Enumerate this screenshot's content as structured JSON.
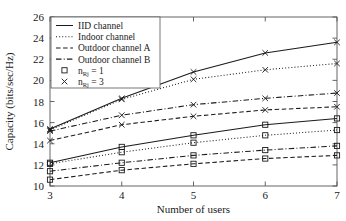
{
  "chart_data": {
    "type": "line",
    "title": "",
    "xlabel": "Number of users",
    "ylabel": "Capacity (bits/sec/Hz)",
    "x": [
      3,
      4,
      5,
      6,
      7
    ],
    "xlim": [
      3,
      7
    ],
    "ylim": [
      10,
      26
    ],
    "xticks": [
      "3",
      "4",
      "5",
      "6",
      "7"
    ],
    "yticks": [
      "10",
      "12",
      "14",
      "16",
      "18",
      "20",
      "22",
      "24",
      "26"
    ],
    "grid": false,
    "legend_position": "top-left",
    "series": [
      {
        "name": "IID channel, n_Rj = 3",
        "channel": "IID channel",
        "marker": "x",
        "linestyle": "solid",
        "values": [
          15.4,
          18.3,
          20.8,
          22.6,
          23.6
        ]
      },
      {
        "name": "Indoor channel, n_Rj = 3",
        "channel": "Indoor channel",
        "marker": "x",
        "linestyle": "dotted",
        "values": [
          15.3,
          18.2,
          20.1,
          21.0,
          21.6
        ]
      },
      {
        "name": "Outdoor channel B, n_Rj = 3",
        "channel": "Outdoor channel B",
        "marker": "x",
        "linestyle": "dashdot",
        "values": [
          15.2,
          16.7,
          17.7,
          18.3,
          18.8
        ]
      },
      {
        "name": "Outdoor channel A, n_Rj = 3",
        "channel": "Outdoor channel A",
        "marker": "x",
        "linestyle": "dashed",
        "values": [
          14.3,
          15.8,
          16.6,
          17.2,
          17.5
        ]
      },
      {
        "name": "IID channel, n_Rj = 1",
        "channel": "IID channel",
        "marker": "square",
        "linestyle": "solid",
        "values": [
          12.2,
          13.7,
          14.8,
          15.8,
          16.4
        ]
      },
      {
        "name": "Indoor channel, n_Rj = 1",
        "channel": "Indoor channel",
        "marker": "square",
        "linestyle": "dotted",
        "values": [
          12.1,
          13.2,
          14.1,
          14.8,
          15.3
        ]
      },
      {
        "name": "Outdoor channel B, n_Rj = 1",
        "channel": "Outdoor channel B",
        "marker": "square",
        "linestyle": "dashdot",
        "values": [
          11.4,
          12.2,
          12.9,
          13.4,
          13.8
        ]
      },
      {
        "name": "Outdoor channel A, n_Rj = 1",
        "channel": "Outdoor channel A",
        "marker": "square",
        "linestyle": "dashed",
        "values": [
          10.6,
          11.5,
          12.1,
          12.6,
          12.9
        ]
      }
    ]
  },
  "legend": {
    "entries": [
      {
        "label": "IID channel",
        "kind": "line",
        "style": "solid"
      },
      {
        "label": "Indoor channel",
        "kind": "line",
        "style": "dotted"
      },
      {
        "label": "Outdoor channel A",
        "kind": "line",
        "style": "dashed"
      },
      {
        "label": "Outdoor channel B",
        "kind": "line",
        "style": "dashdot"
      },
      {
        "label": "n",
        "sub": "Rj",
        "eq": " = 1",
        "kind": "marker",
        "style": "square"
      },
      {
        "label": "n",
        "sub": "Rj",
        "eq": " = 3",
        "kind": "marker",
        "style": "x"
      }
    ]
  },
  "colors": {
    "line": "#1a1a1a",
    "axis": "#555555",
    "background": "#ffffff"
  }
}
